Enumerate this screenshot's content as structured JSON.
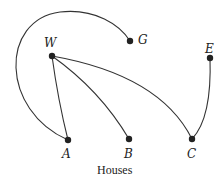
{
  "diagram": {
    "caption": "Houses",
    "nodes": [
      {
        "id": "W",
        "label": "W",
        "x": 52,
        "y": 56
      },
      {
        "id": "G",
        "label": "G",
        "x": 130,
        "y": 41
      },
      {
        "id": "E",
        "label": "E",
        "x": 210,
        "y": 58
      },
      {
        "id": "A",
        "label": "A",
        "x": 68,
        "y": 140
      },
      {
        "id": "B",
        "label": "B",
        "x": 129,
        "y": 139
      },
      {
        "id": "C",
        "label": "C",
        "x": 192,
        "y": 139
      }
    ],
    "edges": [
      {
        "from": "W",
        "to": "A"
      },
      {
        "from": "W",
        "to": "B"
      },
      {
        "from": "W",
        "to": "C"
      },
      {
        "from": "A",
        "to": "G"
      },
      {
        "from": "E",
        "to": "C"
      }
    ],
    "colors": {
      "stroke": "#333333",
      "node": "#222222"
    }
  }
}
